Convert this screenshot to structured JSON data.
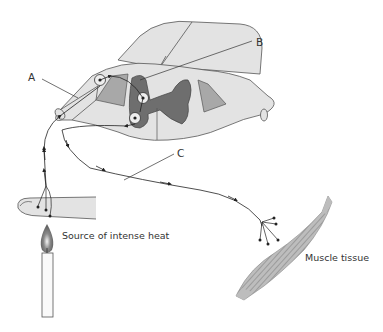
{
  "diagram": {
    "labels": {
      "a": "A",
      "b": "B",
      "c": "C"
    },
    "captions": {
      "heat_source": "Source of intense heat",
      "muscle": "Muscle tissue"
    },
    "colors": {
      "white_matter": "#e3e3e3",
      "grey_matter": "#6e6e6e",
      "ganglion": "#a8a8a8",
      "outline": "#555555",
      "nerve": "#222222",
      "muscle": "#9a9a9a",
      "flame": "#777777"
    }
  }
}
